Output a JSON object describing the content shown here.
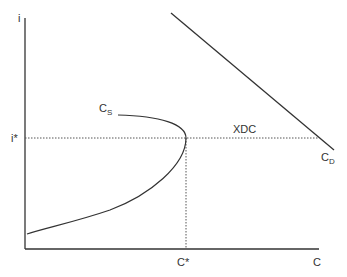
{
  "diagram": {
    "type": "economics-supply-demand",
    "axes": {
      "y_label": "i",
      "x_label": "C"
    },
    "equilibrium": {
      "i_label": "i*",
      "c_label": "C*"
    },
    "curves": {
      "supply": {
        "label": "C",
        "subscript": "S"
      },
      "demand": {
        "label": "C",
        "subscript": "D"
      }
    },
    "gap_label": "XDC",
    "colors": {
      "line": "#333333",
      "dotted": "#555555",
      "background": "#ffffff"
    }
  }
}
